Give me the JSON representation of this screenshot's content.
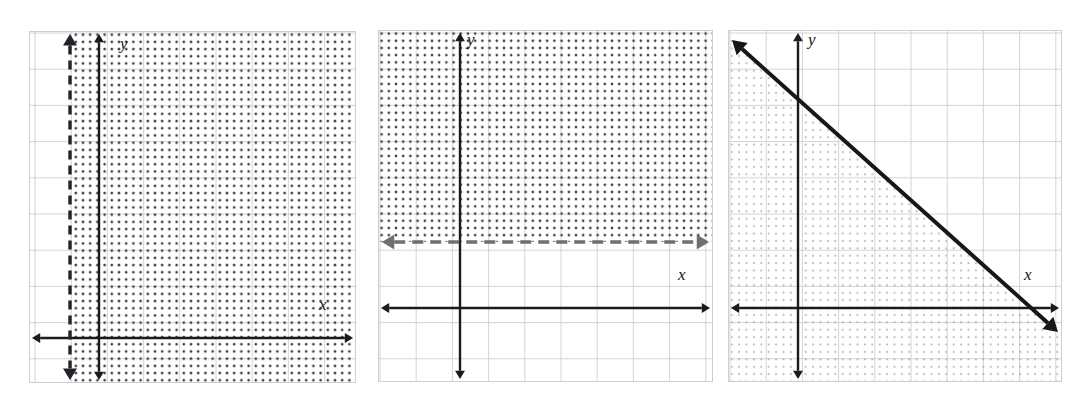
{
  "sheet": {
    "background": "#ffffff",
    "width": 1086,
    "height": 398,
    "description": "Three coordinate-plane graphs of linear inequalities, scanned worksheet style"
  },
  "style": {
    "axis_color": "#1a1a1f",
    "grid_color": "#c8c8cc",
    "grid_color_light": "#d9d9dd",
    "panel_border": "#cfcfd3",
    "dash_line_dark": "#222228",
    "dash_line_gray": "#6e6e74",
    "shade_dot_dark": "#2a2a30",
    "shade_dot_light": "#9a9aa0",
    "solid_line": "#16161b"
  },
  "panels": [
    {
      "id": "panel-1",
      "x": 29,
      "y": 31,
      "width": 327,
      "height": 352,
      "grid": {
        "cell": 36.2,
        "offset_x": 6,
        "offset_y": 2
      },
      "axes": {
        "x_axis_y": 307,
        "y_axis_x": 70,
        "x_label": "x",
        "y_label": "y",
        "x_label_pos": {
          "x": 290,
          "y": 265
        },
        "y_label_pos": {
          "x": 91,
          "y": 4
        }
      },
      "boundary": {
        "kind": "vertical",
        "style": "dashed",
        "color": "#222228",
        "at": 41,
        "arrow_both_ends": true
      },
      "shading": {
        "region": "right-of-line",
        "density": "dark",
        "dot_spacing": 7.2,
        "dot_radius": 1.35
      }
    },
    {
      "id": "panel-2",
      "x": 378,
      "y": 30,
      "width": 335,
      "height": 352,
      "grid": {
        "cell": 36.2,
        "offset_x": 2,
        "offset_y": 3
      },
      "axes": {
        "x_axis_y": 278,
        "y_axis_x": 82,
        "x_label": "x",
        "y_label": "y",
        "x_label_pos": {
          "x": 300,
          "y": 236
        },
        "y_label_pos": {
          "x": 89,
          "y": 1
        }
      },
      "boundary": {
        "kind": "horizontal",
        "style": "dashed",
        "color": "#6e6e74",
        "at": 212,
        "arrow_both_ends": true
      },
      "shading": {
        "region": "above-line",
        "density": "dark",
        "dot_spacing": 7.2,
        "dot_radius": 1.3
      }
    },
    {
      "id": "panel-3",
      "x": 728,
      "y": 30,
      "width": 334,
      "height": 352,
      "grid": {
        "cell": 36.2,
        "offset_x": 2,
        "offset_y": 3
      },
      "axes": {
        "x_axis_y": 278,
        "y_axis_x": 70,
        "x_label": "x",
        "y_label": "y",
        "x_label_pos": {
          "x": 296,
          "y": 236
        },
        "y_label_pos": {
          "x": 80,
          "y": 1
        }
      },
      "boundary": {
        "kind": "diagonal",
        "style": "solid",
        "color": "#16161b",
        "from": {
          "x": 4,
          "y": 10
        },
        "to": {
          "x": 330,
          "y": 302
        },
        "arrow_both_ends": true
      },
      "shading": {
        "region": "below-left-of-line",
        "density": "light",
        "dot_spacing": 7.4,
        "dot_radius": 1.1
      }
    }
  ],
  "chart_data": {
    "type": "line",
    "title": "",
    "xlabel": "x",
    "ylabel": "y",
    "grid": true,
    "legend": "none",
    "plots": [
      {
        "name": "Graph 1 — vertical dashed boundary",
        "boundary_line": "x = -1",
        "line_style": "dashed",
        "shaded_region": "x > -1 (right of line)",
        "inequality": "x > -1",
        "xlim": [
          -3,
          6
        ],
        "ylim": [
          -2,
          8
        ]
      },
      {
        "name": "Graph 2 — horizontal dashed boundary",
        "boundary_line": "y = 2",
        "line_style": "dashed",
        "shaded_region": "y > 2 (above line)",
        "inequality": "y > 2",
        "xlim": [
          -2,
          7
        ],
        "ylim": [
          -2,
          8
        ]
      },
      {
        "name": "Graph 3 — diagonal solid boundary",
        "boundary_line": "y = -x + 7",
        "line_style": "solid",
        "shaded_region": "below and left of line",
        "inequality": "y <= -x + 7",
        "xlim": [
          -2,
          7
        ],
        "ylim": [
          -2,
          8
        ]
      }
    ]
  }
}
